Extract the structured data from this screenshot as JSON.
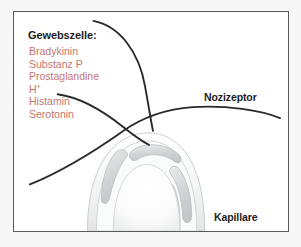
{
  "figure": {
    "background_color": "#ffffff",
    "outer_margin_color": "#f7f7f7",
    "frame_color": "#5b5b5b",
    "nerve_fiber_color": "#2a2a2a",
    "mediator_text_color": "#c4766d",
    "heading_text_color": "#1d1d1d",
    "endothelium_fill": "#d8dadb",
    "vessel_wall_fill": "#f2f3f3"
  },
  "tissue_cell": {
    "heading": "Gewebszelle:",
    "mediators": [
      {
        "name": "Bradykinin",
        "superscript": ""
      },
      {
        "name": "Substanz P",
        "superscript": ""
      },
      {
        "name": "Prostaglandine",
        "superscript": ""
      },
      {
        "name": "H",
        "superscript": "+"
      },
      {
        "name": "Histamin",
        "superscript": ""
      },
      {
        "name": "Serotonin",
        "superscript": ""
      }
    ]
  },
  "labels": {
    "nociceptor": "Nozizeptor",
    "capillary": "Kapillare"
  }
}
